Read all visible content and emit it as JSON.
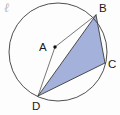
{
  "figure": {
    "background_color": "#fdfdfd",
    "stroke_color": "#3b3b3b",
    "thin_stroke_color": "#555555",
    "shaded_fill": "#9fadd8",
    "shaded_stroke": "#4a5580",
    "label_color": "#1a1a1a",
    "script_mark": {
      "text": "ℓ",
      "name": "circle-name-script-mark",
      "x": 4,
      "y": 12,
      "color": "#b9b9b9"
    },
    "circle": {
      "center_x": 58,
      "center_y": 52,
      "radius": 49,
      "stroke_width": 0.9
    },
    "points": [
      {
        "id": "A",
        "label": "A",
        "x": 55,
        "y": 47,
        "label_x": 39,
        "label_y": 51,
        "is_center": true,
        "dot_radius": 1.7
      },
      {
        "id": "B",
        "label": "B",
        "x": 96,
        "y": 15,
        "label_x": 99,
        "label_y": 12,
        "is_center": false,
        "dot_radius": 0
      },
      {
        "id": "C",
        "label": "C",
        "x": 105,
        "y": 63,
        "label_x": 108,
        "label_y": 68,
        "is_center": false,
        "dot_radius": 0
      },
      {
        "id": "D",
        "label": "D",
        "x": 38,
        "y": 96,
        "label_x": 32,
        "label_y": 110,
        "is_center": false,
        "dot_radius": 0
      }
    ],
    "segments": [
      {
        "from": "A",
        "to": "B",
        "name": "segment-a-b",
        "width": 0.8,
        "style": "thin"
      },
      {
        "from": "A",
        "to": "D",
        "name": "segment-a-d",
        "width": 0.8,
        "style": "thin"
      },
      {
        "from": "B",
        "to": "D",
        "name": "chord-b-d",
        "width": 0.9,
        "style": "normal"
      },
      {
        "from": "B",
        "to": "C",
        "name": "chord-b-c",
        "width": 0.9,
        "style": "normal"
      },
      {
        "from": "C",
        "to": "D",
        "name": "chord-c-d",
        "width": 0.9,
        "style": "normal"
      }
    ],
    "shaded_triangle": {
      "name": "shaded-triangle-bcd",
      "vertices": [
        "B",
        "C",
        "D"
      ],
      "fill": "#9fadd8",
      "fill_opacity": 0.95
    }
  }
}
